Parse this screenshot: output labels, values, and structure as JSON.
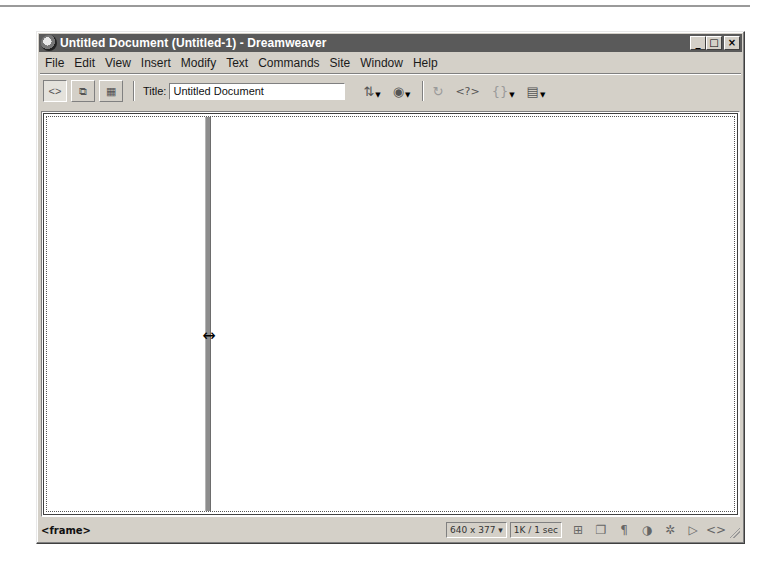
{
  "window": {
    "title": "Untitled Document (Untitled-1) - Dreamweaver",
    "controls": {
      "minimize": "_",
      "maximize": "□",
      "close": "×"
    }
  },
  "menubar": {
    "items": [
      {
        "label": "File",
        "mnemonic": "F"
      },
      {
        "label": "Edit",
        "mnemonic": "E"
      },
      {
        "label": "View",
        "mnemonic": "V"
      },
      {
        "label": "Insert",
        "mnemonic": "I"
      },
      {
        "label": "Modify",
        "mnemonic": "M"
      },
      {
        "label": "Text",
        "mnemonic": "T"
      },
      {
        "label": "Commands",
        "mnemonic": "C"
      },
      {
        "label": "Site",
        "mnemonic": "S"
      },
      {
        "label": "Window",
        "mnemonic": "W"
      },
      {
        "label": "Help",
        "mnemonic": "H"
      }
    ]
  },
  "toolbar": {
    "view_buttons": [
      {
        "name": "code-view",
        "glyph": "<>"
      },
      {
        "name": "code-and-design-view",
        "glyph": "⧉"
      },
      {
        "name": "design-view",
        "glyph": "▦"
      }
    ],
    "title_label": "Title:",
    "title_value": "Untitled Document",
    "tools": [
      {
        "name": "file-management",
        "glyph": "⇅",
        "dropdown": true,
        "dim": false
      },
      {
        "name": "preview-in-browser",
        "glyph": "◉",
        "dropdown": true,
        "dim": false
      },
      {
        "name": "refresh",
        "glyph": "↻",
        "dropdown": false,
        "dim": true
      },
      {
        "name": "reference",
        "glyph": "<?>",
        "dropdown": false,
        "dim": false
      },
      {
        "name": "code-navigation",
        "glyph": "{}",
        "dropdown": true,
        "dim": true
      },
      {
        "name": "view-options",
        "glyph": "▤",
        "dropdown": true,
        "dim": false
      }
    ]
  },
  "document": {
    "cursor": "↔"
  },
  "statusbar": {
    "tag_selector": "<frame>",
    "window_size": "640 x 377 ▾",
    "download_stats": "1K / 1 sec",
    "launchers": [
      {
        "name": "site",
        "glyph": "⊞"
      },
      {
        "name": "assets",
        "glyph": "❐"
      },
      {
        "name": "html-styles",
        "glyph": "¶"
      },
      {
        "name": "css-styles",
        "glyph": "◑"
      },
      {
        "name": "behaviors",
        "glyph": "✲"
      },
      {
        "name": "timelines",
        "glyph": "▷"
      },
      {
        "name": "code-inspector",
        "glyph": "<>"
      }
    ]
  }
}
